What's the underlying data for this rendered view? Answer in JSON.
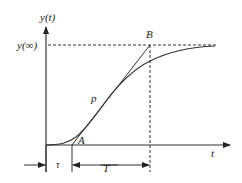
{
  "diagram": {
    "labels": {
      "y_axis": "y(t)",
      "y_inf": "y(∞)",
      "x_axis": "t",
      "point_B": "B",
      "point_A": "A",
      "point_p": "p",
      "tau": "τ",
      "T": "T"
    },
    "colors": {
      "line": "#333333",
      "background": "#ffffff"
    }
  }
}
